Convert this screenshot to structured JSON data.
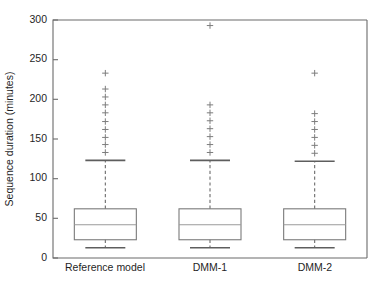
{
  "chart_data": {
    "type": "box",
    "title": "",
    "xlabel": "",
    "ylabel": "Sequence duration (minutes)",
    "ylim": [
      0,
      300
    ],
    "yticks": [
      0,
      50,
      100,
      150,
      200,
      250,
      300
    ],
    "ytick_labels": [
      "0",
      "50",
      "100",
      "150",
      "200",
      "250",
      "300"
    ],
    "grid": false,
    "legend": "none",
    "categories": [
      "Reference model",
      "DMM-1",
      "DMM-2"
    ],
    "series": [
      {
        "name": "Reference model",
        "whisker_low": 13,
        "q1": 23,
        "median": 42,
        "q3": 62,
        "whisker_high": 123,
        "outliers": [
          133,
          143,
          152,
          162,
          172,
          183,
          193,
          203,
          213,
          233
        ]
      },
      {
        "name": "DMM-1",
        "whisker_low": 13,
        "q1": 23,
        "median": 42,
        "q3": 62,
        "whisker_high": 123,
        "outliers": [
          133,
          143,
          153,
          163,
          173,
          183,
          193,
          293
        ]
      },
      {
        "name": "DMM-2",
        "whisker_low": 13,
        "q1": 23,
        "median": 42,
        "q3": 62,
        "whisker_high": 122,
        "outliers": [
          132,
          142,
          152,
          162,
          172,
          182,
          233
        ]
      }
    ]
  },
  "axes": {
    "y_axis_label": "Sequence duration (minutes)",
    "y_tick_0": "0",
    "y_tick_1": "50",
    "y_tick_2": "100",
    "y_tick_3": "150",
    "y_tick_4": "200",
    "y_tick_5": "250",
    "y_tick_6": "300",
    "x_tick_0": "Reference model",
    "x_tick_1": "DMM-1",
    "x_tick_2": "DMM-2"
  },
  "colors": {
    "background": "#ffffff",
    "axis": "#6b6b6b",
    "box": "#7a7a7a",
    "median": "#9a9a9a",
    "outlier": "#7d7d7d",
    "text": "#1f1f1f"
  }
}
